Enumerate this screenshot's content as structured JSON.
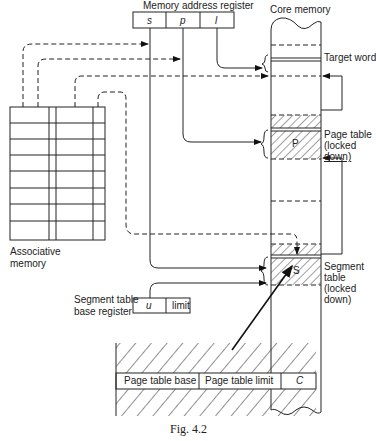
{
  "diagram": {
    "caption": "Fig. 4.2",
    "memory_address_register": {
      "title": "Memory address register",
      "fields": [
        "s",
        "p",
        "l"
      ]
    },
    "core_memory": {
      "title": "Core memory",
      "target_word": "Target word",
      "page_table": [
        "Page table",
        "(locked",
        "down)"
      ],
      "page_table_marker": "P",
      "segment_table": [
        "Segment",
        "table",
        "(locked",
        "down)"
      ],
      "segment_table_marker": "S"
    },
    "associative_memory": {
      "label": [
        "Associative",
        "memory"
      ],
      "rows": 8
    },
    "segment_table_base_register": {
      "label": [
        "Segment table",
        "base register"
      ],
      "fields": [
        "u",
        "limit"
      ]
    },
    "segment_table_entry": {
      "fields": [
        "Page table base",
        "Page table limit",
        "C"
      ]
    }
  }
}
